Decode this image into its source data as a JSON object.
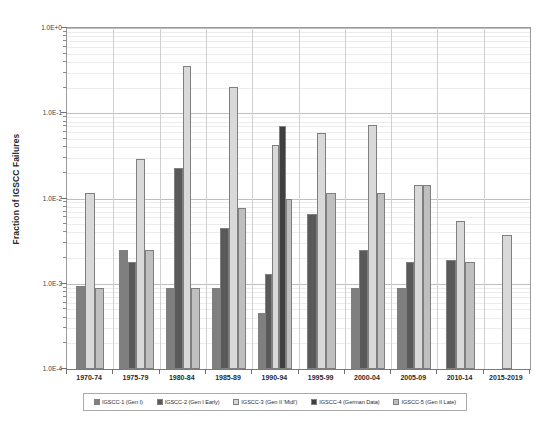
{
  "chart_data": {
    "type": "bar",
    "title": "",
    "subtitle": "",
    "xlabel": "",
    "ylabel": "Fraction of IGSCC Failures",
    "yscale": "log",
    "ylim": [
      0.0001,
      1.0
    ],
    "grid": true,
    "legend_position": "bottom",
    "y_ticks": [
      "1.0E+0",
      "1.0E-1",
      "1.0E-2",
      "1.0E-3",
      "1.0E-4"
    ],
    "y_tick_values": [
      1.0,
      0.1,
      0.01,
      0.001,
      0.0001
    ],
    "categories": [
      "1970-74",
      "1975-79",
      "1980-84",
      "1985-89",
      "1990-94",
      "1995-99",
      "2000-04",
      "2005-09",
      "2010-14",
      "2015-2019"
    ],
    "series": [
      {
        "name": "IGSCC-1 (Gen I)",
        "color": "#7f7f7f",
        "values": [
          0.00095,
          0.0025,
          0.0009,
          0.0009,
          0.00045,
          null,
          0.0009,
          0.0009,
          null,
          null
        ]
      },
      {
        "name": "IGSCC-2 (Gen I Early)",
        "color": "#595959",
        "values": [
          null,
          0.0018,
          0.023,
          0.0045,
          0.0013,
          0.0065,
          0.0025,
          0.0018,
          0.0019,
          null
        ]
      },
      {
        "name": "IGSCC-3 (Gen II 'Midl')",
        "color": "#d9d9d9",
        "values": [
          0.0115,
          0.029,
          0.36,
          0.205,
          0.042,
          0.058,
          0.073,
          0.0145,
          0.0055,
          0.0037
        ]
      },
      {
        "name": "IGSCC-4 (German Data)",
        "color": "#404040",
        "values": [
          null,
          null,
          null,
          null,
          0.071,
          null,
          null,
          null,
          null,
          null
        ]
      },
      {
        "name": "IGSCC-5 (Gen II Late)",
        "color": "#bfbfbf",
        "values": [
          0.0009,
          0.0025,
          0.0009,
          0.0078,
          0.0098,
          0.0115,
          0.0115,
          0.0145,
          0.0018,
          null
        ]
      }
    ]
  },
  "legend": {
    "entries": [
      {
        "label": "IGSCC-1 (Gen I)",
        "color": "#7f7f7f"
      },
      {
        "label": "IGSCC-2 (Gen I Early)",
        "color": "#595959"
      },
      {
        "label": "IGSCC-3 (Gen II 'Midl')",
        "color": "#d9d9d9"
      },
      {
        "label": "IGSCC-4 (German Data)",
        "color": "#404040"
      },
      {
        "label": "IGSCC-5 (Gen II Late)",
        "color": "#bfbfbf"
      }
    ]
  }
}
